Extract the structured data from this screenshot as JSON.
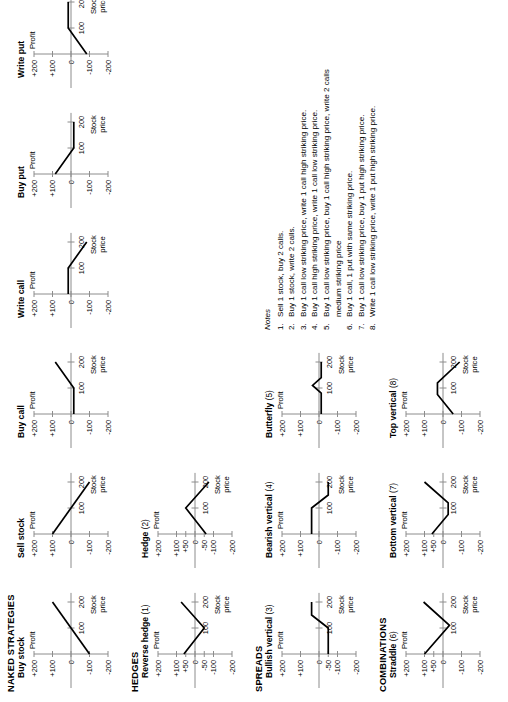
{
  "sections": [
    {
      "id": "naked",
      "label": "NAKED STRATEGIES"
    },
    {
      "id": "hedges",
      "label": "HEDGES"
    },
    {
      "id": "spreads",
      "label": "SPREADS"
    },
    {
      "id": "combinations",
      "label": "COMBINATIONS"
    }
  ],
  "axis": {
    "y_label": "Profit",
    "x_label_line1": "Stock",
    "x_label_line2": "price",
    "y_ticks_full": [
      "+200",
      "+100",
      "0",
      "-100",
      "-200"
    ],
    "y_ticks_with50": [
      "+200",
      "+100",
      "+50",
      "0",
      "-50",
      "-100",
      "-200"
    ],
    "x_ticks": [
      "100",
      "200"
    ]
  },
  "charts": [
    {
      "name": "buy-stock",
      "title": "Buy stock",
      "note": "",
      "row": 0,
      "col": 0,
      "yticks": [
        "+200",
        "+100",
        "0",
        "-100",
        "-200"
      ],
      "xticks": [
        "100",
        "200"
      ],
      "points": [
        [
          0,
          -100
        ],
        [
          200,
          100
        ]
      ],
      "desc": "Long stock: straight upward line crossing zero at 100."
    },
    {
      "name": "sell-stock",
      "title": "Sell stock",
      "note": "",
      "row": 0,
      "col": 1,
      "yticks": [
        "+200",
        "+100",
        "0",
        "-100",
        "-200"
      ],
      "xticks": [
        "100",
        "200"
      ],
      "points": [
        [
          0,
          100
        ],
        [
          200,
          -100
        ]
      ],
      "desc": "Short stock: straight downward line crossing zero at 100."
    },
    {
      "name": "buy-call",
      "title": "Buy call",
      "note": "",
      "row": 0,
      "col": 2,
      "yticks": [
        "+200",
        "+100",
        "0",
        "-100",
        "-200"
      ],
      "xticks": [
        "100",
        "200"
      ],
      "points": [
        [
          0,
          -15
        ],
        [
          100,
          -15
        ],
        [
          200,
          85
        ]
      ],
      "desc": "Long call: flat small loss then rising past striking price 100."
    },
    {
      "name": "write-call",
      "title": "Write call",
      "note": "",
      "row": 0,
      "col": 3,
      "yticks": [
        "+200",
        "+100",
        "0",
        "-100",
        "-200"
      ],
      "xticks": [
        "100",
        "200"
      ],
      "points": [
        [
          0,
          15
        ],
        [
          100,
          15
        ],
        [
          200,
          -85
        ]
      ],
      "desc": "Short call: flat small gain then falling past striking price 100."
    },
    {
      "name": "buy-put",
      "title": "Buy put",
      "note": "",
      "row": 0,
      "col": 4,
      "yticks": [
        "+200",
        "+100",
        "0",
        "-100",
        "-200"
      ],
      "xticks": [
        "100",
        "200"
      ],
      "points": [
        [
          0,
          85
        ],
        [
          100,
          -15
        ],
        [
          200,
          -15
        ]
      ],
      "desc": "Long put: falling to striking price 100 then flat small loss."
    },
    {
      "name": "write-put",
      "title": "Write put",
      "note": "",
      "row": 0,
      "col": 5,
      "yticks": [
        "+200",
        "+100",
        "0",
        "-100",
        "-200"
      ],
      "xticks": [
        "100",
        "200"
      ],
      "points": [
        [
          0,
          -85
        ],
        [
          100,
          15
        ],
        [
          200,
          15
        ]
      ],
      "desc": "Short put: rising to striking price 100 then flat small gain."
    },
    {
      "name": "reverse-hedge",
      "title": "Reverse hedge",
      "note": "(1)",
      "row": 1,
      "col": 0,
      "yticks": [
        "+200",
        "+100",
        "+50",
        "0",
        "-50",
        "-100",
        "-200"
      ],
      "xticks": [
        "100",
        "200"
      ],
      "points": [
        [
          0,
          60
        ],
        [
          100,
          -50
        ],
        [
          200,
          75
        ]
      ],
      "desc": "V shape, apex at striking price 100 at -50."
    },
    {
      "name": "hedge",
      "title": "Hedge",
      "note": "(2)",
      "row": 1,
      "col": 1,
      "yticks": [
        "+200",
        "+100",
        "+50",
        "0",
        "-50",
        "-100",
        "-200"
      ],
      "xticks": [
        "100",
        "200"
      ],
      "points": [
        [
          0,
          -60
        ],
        [
          100,
          50
        ],
        [
          200,
          -75
        ]
      ],
      "desc": "Inverted V, peak at striking price 100 at +50."
    },
    {
      "name": "bullish-vertical",
      "title": "Bullish vertical",
      "note": "(3)",
      "row": 2,
      "col": 0,
      "yticks": [
        "+200",
        "+100",
        "0",
        "-50",
        "-100",
        "-200"
      ],
      "xticks": [
        "100",
        "200"
      ],
      "points": [
        [
          0,
          -50
        ],
        [
          100,
          -50
        ],
        [
          150,
          40
        ],
        [
          200,
          40
        ]
      ],
      "desc": "Bull call spread: flat -50 then rise to flat +40."
    },
    {
      "name": "bearish-vertical",
      "title": "Bearish vertical",
      "note": "(4)",
      "row": 2,
      "col": 1,
      "yticks": [
        "+200",
        "+100",
        "0",
        "-100",
        "-200"
      ],
      "xticks": [
        "100",
        "200"
      ],
      "points": [
        [
          0,
          40
        ],
        [
          100,
          40
        ],
        [
          150,
          -50
        ],
        [
          200,
          -50
        ]
      ],
      "desc": "Bear call spread: flat +40 then drop to flat -50."
    },
    {
      "name": "butterfly",
      "title": "Butterfly",
      "note": "(5)",
      "row": 2,
      "col": 2,
      "yticks": [
        "+200",
        "+100",
        "0",
        "-100",
        "-200"
      ],
      "xticks": [
        "100",
        "200"
      ],
      "points": [
        [
          0,
          -12
        ],
        [
          80,
          -12
        ],
        [
          110,
          35
        ],
        [
          140,
          -12
        ],
        [
          200,
          -12
        ]
      ],
      "desc": "Butterfly: flat small loss, small peak near 100, back to flat loss."
    },
    {
      "name": "straddle",
      "title": "Straddle",
      "note": "(6)",
      "row": 3,
      "col": 0,
      "yticks": [
        "+200",
        "+100",
        "+50",
        "0",
        "-100",
        "-200"
      ],
      "xticks": [
        "100",
        "200"
      ],
      "points": [
        [
          0,
          100
        ],
        [
          110,
          -35
        ],
        [
          200,
          105
        ]
      ],
      "desc": "Long straddle: V shape bottoming below zero at striking price."
    },
    {
      "name": "bottom-vertical",
      "title": "Bottom vertical",
      "note": "(7)",
      "row": 3,
      "col": 1,
      "yticks": [
        "+200",
        "+100",
        "+50",
        "0",
        "-100",
        "-200"
      ],
      "xticks": [
        "100",
        "200"
      ],
      "points": [
        [
          0,
          60
        ],
        [
          75,
          -28
        ],
        [
          120,
          -28
        ],
        [
          200,
          100
        ]
      ],
      "desc": "Bottom vertical combination: flat bottom trough between strikes."
    },
    {
      "name": "top-vertical",
      "title": "Top vertical",
      "note": "(8)",
      "row": 3,
      "col": 2,
      "yticks": [
        "+200",
        "+100",
        "0",
        "-100",
        "-200"
      ],
      "xticks": [
        "100",
        "200"
      ],
      "points": [
        [
          0,
          -55
        ],
        [
          75,
          30
        ],
        [
          120,
          30
        ],
        [
          200,
          -90
        ]
      ],
      "desc": "Top vertical combination: flat top plateau between strikes."
    }
  ],
  "notes": {
    "heading": "Notes",
    "items": [
      {
        "n": "1.",
        "text": "Sell 1 stock, buy 2 calls."
      },
      {
        "n": "2.",
        "text": "Buy 1 stock, write 2 calls."
      },
      {
        "n": "3.",
        "text": "Buy 1 call low striking price, write 1 call high striking price."
      },
      {
        "n": "4.",
        "text": "Buy 1 call high striking price, write 1 call low striking price."
      },
      {
        "n": "5.",
        "text": "Buy 1 call low striking price, buy 1 call high striking price, write 2 calls",
        "cont": "medium striking price"
      },
      {
        "n": "6.",
        "text": "Buy 1 call, 1 put with same striking price."
      },
      {
        "n": "7.",
        "text": "Buy 1 call low striking price, buy 1 put high striking price."
      },
      {
        "n": "8.",
        "text": "Write 1 call low striking price, write 1 put high striking price."
      }
    ]
  },
  "chart_data": {
    "type": "line",
    "xlabel": "Stock price",
    "ylabel": "Profit",
    "xlim": [
      0,
      230
    ],
    "ylim": [
      -200,
      200
    ],
    "grid": false,
    "legend": "none",
    "x_tick_values": [
      100,
      200
    ],
    "y_tick_values": [
      200,
      100,
      50,
      0,
      -50,
      -100,
      -200
    ],
    "series": [
      {
        "name": "Buy stock",
        "x": [
          0,
          200
        ],
        "y": [
          -100,
          100
        ]
      },
      {
        "name": "Sell stock",
        "x": [
          0,
          200
        ],
        "y": [
          100,
          -100
        ]
      },
      {
        "name": "Buy call",
        "x": [
          0,
          100,
          200
        ],
        "y": [
          -15,
          -15,
          85
        ]
      },
      {
        "name": "Write call",
        "x": [
          0,
          100,
          200
        ],
        "y": [
          15,
          15,
          -85
        ]
      },
      {
        "name": "Buy put",
        "x": [
          0,
          100,
          200
        ],
        "y": [
          85,
          -15,
          -15
        ]
      },
      {
        "name": "Write put",
        "x": [
          0,
          100,
          200
        ],
        "y": [
          -85,
          15,
          15
        ]
      },
      {
        "name": "Reverse hedge (1)",
        "x": [
          0,
          100,
          200
        ],
        "y": [
          60,
          -50,
          75
        ]
      },
      {
        "name": "Hedge (2)",
        "x": [
          0,
          100,
          200
        ],
        "y": [
          -60,
          50,
          -75
        ]
      },
      {
        "name": "Bullish vertical (3)",
        "x": [
          0,
          100,
          150,
          200
        ],
        "y": [
          -50,
          -50,
          40,
          40
        ]
      },
      {
        "name": "Bearish vertical (4)",
        "x": [
          0,
          100,
          150,
          200
        ],
        "y": [
          40,
          40,
          -50,
          -50
        ]
      },
      {
        "name": "Butterfly (5)",
        "x": [
          0,
          80,
          110,
          140,
          200
        ],
        "y": [
          -12,
          -12,
          35,
          -12,
          -12
        ]
      },
      {
        "name": "Straddle (6)",
        "x": [
          0,
          110,
          200
        ],
        "y": [
          100,
          -35,
          105
        ]
      },
      {
        "name": "Bottom vertical (7)",
        "x": [
          0,
          75,
          120,
          200
        ],
        "y": [
          60,
          -28,
          -28,
          100
        ]
      },
      {
        "name": "Top vertical (8)",
        "x": [
          0,
          75,
          120,
          200
        ],
        "y": [
          -55,
          30,
          30,
          -90
        ]
      }
    ]
  }
}
